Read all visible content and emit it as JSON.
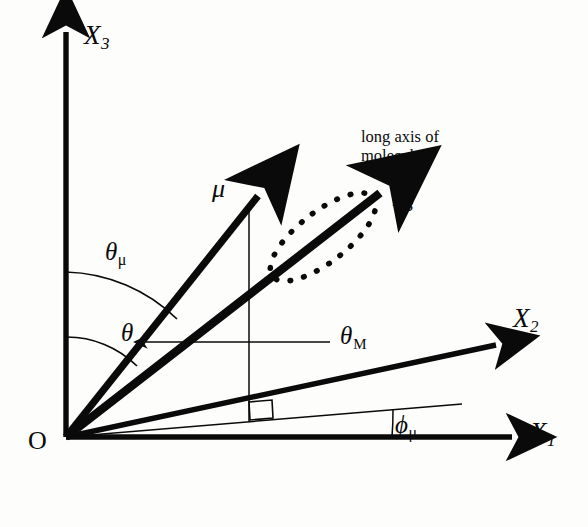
{
  "figure": {
    "background_color": "#fdfdfc",
    "ink_color": "#0a0a0a",
    "origin_label": "O",
    "note_text": "long axis of\nmolecule"
  },
  "axes": [
    {
      "name": "X3",
      "label_base": "X",
      "label_sub": "3",
      "description": "laboratory vertical axis",
      "kind": "lab-frame-axis"
    },
    {
      "name": "X2",
      "label_base": "X",
      "label_sub": "2",
      "description": "laboratory axis into the page-right",
      "kind": "lab-frame-axis"
    },
    {
      "name": "X1",
      "label_base": "X",
      "label_sub": "1",
      "description": "laboratory horizontal axis",
      "kind": "lab-frame-axis"
    }
  ],
  "vectors": [
    {
      "name": "mu",
      "label_base": "μ",
      "label_sub": "",
      "description": "transition dipole moment vector"
    },
    {
      "name": "x3",
      "label_base": "x",
      "label_sub": "3",
      "description": "molecular long axis (molecule-fixed frame)"
    }
  ],
  "angles": [
    {
      "name": "theta-mu",
      "label_base": "θ",
      "label_sub": "μ",
      "sub_style": "greek",
      "description": "polar angle of the dipole moment from X3"
    },
    {
      "name": "theta",
      "label_base": "θ",
      "label_sub": "",
      "sub_style": "none",
      "description": "polar angle of the molecular long axis from X3"
    },
    {
      "name": "theta-M",
      "label_base": "θ",
      "label_sub": "M",
      "sub_style": "caps",
      "description": "angle between the dipole moment and the molecular long axis"
    },
    {
      "name": "phi-mu",
      "label_base": "ϕ",
      "label_sub": "μ",
      "sub_style": "greek",
      "description": "azimuthal angle of the dipole projection from X1"
    }
  ],
  "annotations": {
    "precession_ellipse": "dotted ellipse showing precession of the dipole about the molecular long axis",
    "right_angle_marker": "right angle between the vertical drop line and the azimuthal projection line",
    "leader_arrow": "leader arrow from the theta-M label to the angle between mu and x3"
  }
}
